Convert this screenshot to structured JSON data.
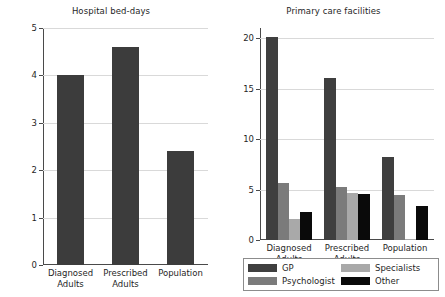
{
  "chart_data": [
    {
      "type": "bar",
      "title": "Hospital bed-days",
      "xlabel": "",
      "ylabel": "",
      "categories": [
        "Diagnosed\nAdults",
        "Prescribed\nAdults",
        "Population"
      ],
      "values": [
        4.0,
        4.6,
        2.4
      ],
      "yticks": [
        0,
        1,
        2,
        3,
        4,
        5
      ],
      "ylim": [
        0,
        5
      ],
      "grid": true,
      "legend": "none",
      "bar_color": "#3c3c3c"
    },
    {
      "type": "bar",
      "title": "Primary care facilities",
      "xlabel": "",
      "ylabel": "",
      "categories": [
        "Diagnosed\nAdults",
        "Prescribed\nAdults",
        "Population"
      ],
      "series": [
        {
          "name": "GP",
          "color": "#3f3f3f",
          "values": [
            20.1,
            16.0,
            8.2
          ]
        },
        {
          "name": "Psychologist",
          "color": "#7b7b7b",
          "values": [
            5.6,
            5.3,
            4.5
          ]
        },
        {
          "name": "Specialists",
          "color": "#a9a9a9",
          "values": [
            2.1,
            4.7,
            0.1
          ]
        },
        {
          "name": "Other",
          "color": "#0a0a0a",
          "values": [
            2.8,
            4.6,
            3.4
          ]
        }
      ],
      "yticks": [
        0,
        5,
        10,
        15,
        20
      ],
      "ylim": [
        0,
        21
      ],
      "grid": true,
      "legend": "bottom"
    }
  ],
  "left_chart": {
    "title": "Hospital bed-days",
    "ytick_labels": [
      "0",
      "1",
      "2",
      "3",
      "4",
      "5"
    ],
    "xtick_labels": [
      "Diagnosed\nAdults",
      "Prescribed\nAdults",
      "Population"
    ]
  },
  "right_chart": {
    "title": "Primary care facilities",
    "ytick_labels": [
      "0",
      "5",
      "10",
      "15",
      "20"
    ],
    "xtick_labels": [
      "Diagnosed\nAdults",
      "Prescribed\nAdults",
      "Population"
    ],
    "legend": {
      "items": [
        {
          "label": "GP"
        },
        {
          "label": "Specialists"
        },
        {
          "label": "Psychologist"
        },
        {
          "label": "Other"
        }
      ]
    }
  }
}
